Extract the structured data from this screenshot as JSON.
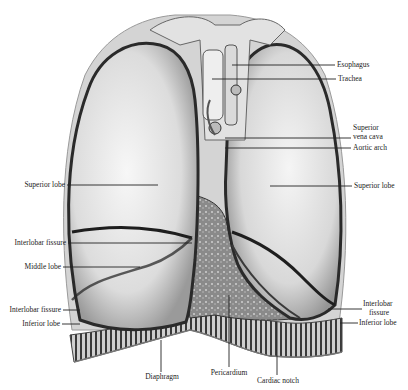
{
  "figure": {
    "labels": {
      "esophagus": "Esophagus",
      "trachea": "Trachea",
      "superior_vena_cava_1": "Superior",
      "superior_vena_cava_2": "vena cava",
      "aortic_arch": "Aortic arch",
      "superior_lobe_right_side": "Superior lobe",
      "superior_lobe_left_side": "Superior lobe",
      "interlobar_fissure_left_side": "Interlobar fissure",
      "middle_lobe": "Middle lobe",
      "interlobar_fissure_lower_left": "Interlobar fissure",
      "inferior_lobe_left_side": "Inferior lobe",
      "interlobar_fissure_right_1": "Interlobar",
      "interlobar_fissure_right_2": "fissure",
      "inferior_lobe_right_side": "Inferior lobe",
      "diaphragm": "Diaphragm",
      "pericardium": "Pericardium",
      "cardiac_notch": "Cardiac notch"
    },
    "colors": {
      "lung_fill": "#e6e6e6",
      "lung_outline": "#2a2a2a",
      "fissure": "#1e1e1e",
      "leader_line": "#222222",
      "diaphragm": "#555555"
    }
  }
}
